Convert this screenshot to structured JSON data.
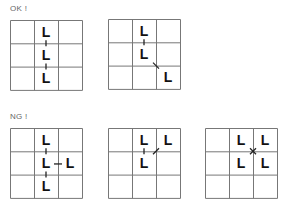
{
  "sections": [
    {
      "label": "OK !",
      "label_pos": [
        10,
        4
      ]
    },
    {
      "label": "NG !",
      "label_pos": [
        10,
        112
      ]
    }
  ],
  "grids": [
    {
      "id": "ok-vertical-chain",
      "pos": [
        10,
        20
      ],
      "cells": [
        [
          0,
          1
        ],
        [
          1,
          1
        ],
        [
          2,
          1
        ]
      ],
      "connections": [
        {
          "type": "vertical",
          "from": [
            0,
            1
          ],
          "to": [
            1,
            1
          ]
        },
        {
          "type": "vertical",
          "from": [
            1,
            1
          ],
          "to": [
            2,
            1
          ]
        }
      ]
    },
    {
      "id": "ok-vertical-diagonal",
      "pos": [
        108,
        19
      ],
      "cells": [
        [
          0,
          1
        ],
        [
          1,
          1
        ],
        [
          2,
          2
        ]
      ],
      "connections": [
        {
          "type": "vertical",
          "from": [
            0,
            1
          ],
          "to": [
            1,
            1
          ]
        },
        {
          "type": "diagonal-down",
          "from": [
            1,
            1
          ],
          "to": [
            2,
            2
          ]
        }
      ]
    },
    {
      "id": "ng-branch",
      "pos": [
        10,
        128
      ],
      "cells": [
        [
          0,
          1
        ],
        [
          1,
          1
        ],
        [
          2,
          1
        ],
        [
          1,
          2
        ]
      ],
      "connections": [
        {
          "type": "vertical",
          "from": [
            0,
            1
          ],
          "to": [
            1,
            1
          ]
        },
        {
          "type": "vertical",
          "from": [
            1,
            1
          ],
          "to": [
            2,
            1
          ]
        },
        {
          "type": "horizontal",
          "from": [
            1,
            1
          ],
          "to": [
            1,
            2
          ]
        }
      ]
    },
    {
      "id": "ng-diagonal-up",
      "pos": [
        108,
        128
      ],
      "cells": [
        [
          0,
          1
        ],
        [
          0,
          2
        ],
        [
          1,
          1
        ]
      ],
      "connections": [
        {
          "type": "vertical",
          "from": [
            0,
            1
          ],
          "to": [
            1,
            1
          ]
        },
        {
          "type": "diagonal-up",
          "from": [
            1,
            1
          ],
          "to": [
            0,
            2
          ]
        }
      ]
    },
    {
      "id": "ng-cross",
      "pos": [
        205,
        128
      ],
      "cells": [
        [
          0,
          1
        ],
        [
          0,
          2
        ],
        [
          1,
          1
        ],
        [
          1,
          2
        ]
      ],
      "connections": [
        {
          "type": "cross",
          "at": [
            1,
            2
          ]
        }
      ]
    }
  ],
  "cell_glyph": "L",
  "colors": {
    "grid_line": "#777777",
    "glyph": "#111111",
    "label": "#666666",
    "connector": "#222222"
  }
}
